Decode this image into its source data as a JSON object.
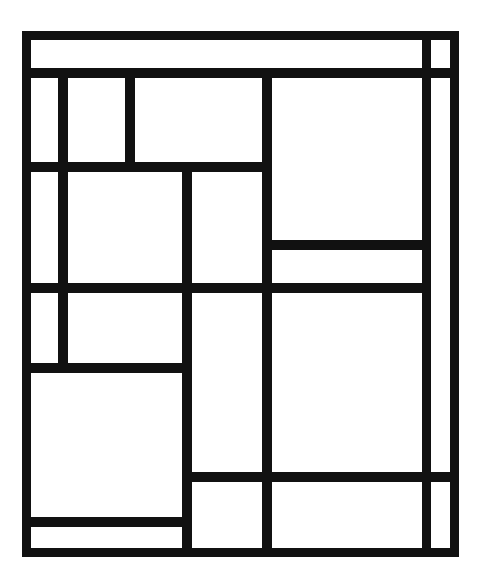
{
  "artwork": {
    "title": "Composition with Grid",
    "style": "De Stijl / Neoplasticism",
    "medium": "Black line grid on white ground",
    "orientation": "portrait",
    "canvas_width": "483",
    "canvas_height": "587",
    "line_color": "#111111",
    "ground_color": "#ffffff",
    "line_count": "18",
    "cell_count": "19"
  },
  "geometry": {
    "frame": {
      "left": 22,
      "top": 31,
      "right": 459,
      "bottom": 557,
      "stroke": 9
    },
    "vertical_lines": [
      {
        "name": "frame-left",
        "x": 22,
        "y1": 31,
        "y2": 557,
        "w": 9
      },
      {
        "name": "v-left-inner",
        "x": 58,
        "y1": 68,
        "y2": 372,
        "w": 10
      },
      {
        "name": "v-upper-short",
        "x": 125,
        "y1": 68,
        "y2": 171,
        "w": 10
      },
      {
        "name": "v-mid-left",
        "x": 182,
        "y1": 162,
        "y2": 557,
        "w": 10
      },
      {
        "name": "v-center",
        "x": 262,
        "y1": 68,
        "y2": 557,
        "w": 10
      },
      {
        "name": "v-right-inner",
        "x": 422,
        "y1": 31,
        "y2": 557,
        "w": 9
      },
      {
        "name": "frame-right",
        "x": 450,
        "y1": 31,
        "y2": 557,
        "w": 9
      }
    ],
    "horizontal_lines": [
      {
        "name": "frame-top",
        "y": 31,
        "x1": 22,
        "x2": 459,
        "h": 9
      },
      {
        "name": "h-top-band",
        "y": 68,
        "x1": 22,
        "x2": 459,
        "h": 10
      },
      {
        "name": "h-second-band",
        "y": 162,
        "x1": 22,
        "x2": 272,
        "h": 10
      },
      {
        "name": "h-right-thin-top",
        "y": 240,
        "x1": 262,
        "x2": 431,
        "h": 10
      },
      {
        "name": "h-third-band",
        "y": 283,
        "x1": 22,
        "x2": 431,
        "h": 10
      },
      {
        "name": "h-left-fourth",
        "y": 363,
        "x1": 22,
        "x2": 192,
        "h": 10
      },
      {
        "name": "h-lower-band",
        "y": 472,
        "x1": 182,
        "x2": 459,
        "h": 10
      },
      {
        "name": "h-bottom-strip",
        "y": 517,
        "x1": 22,
        "x2": 192,
        "h": 10
      },
      {
        "name": "frame-bottom",
        "y": 548,
        "x1": 22,
        "x2": 459,
        "h": 9
      }
    ],
    "cells": [
      {
        "name": "cell-top-left-strip",
        "x": 31,
        "y": 40,
        "w": 94,
        "h": 28
      },
      {
        "name": "cell-top-wide-strip",
        "x": 135,
        "y": 40,
        "w": 287,
        "h": 28
      },
      {
        "name": "cell-top-right-small",
        "x": 431,
        "y": 40,
        "w": 19,
        "h": 28
      },
      {
        "name": "cell-left-tall-a",
        "x": 31,
        "y": 78,
        "w": 27,
        "h": 84
      },
      {
        "name": "cell-upper-square",
        "x": 68,
        "y": 78,
        "w": 57,
        "h": 84
      },
      {
        "name": "cell-upper-wide",
        "x": 135,
        "y": 78,
        "w": 127,
        "h": 84
      },
      {
        "name": "cell-big-right",
        "x": 272,
        "y": 78,
        "w": 150,
        "h": 162
      },
      {
        "name": "cell-left-tall-b",
        "x": 31,
        "y": 172,
        "w": 27,
        "h": 111
      },
      {
        "name": "cell-center-big",
        "x": 68,
        "y": 172,
        "w": 114,
        "h": 111
      },
      {
        "name": "cell-center-narrow",
        "x": 192,
        "y": 172,
        "w": 70,
        "h": 111
      },
      {
        "name": "cell-right-thin-strip",
        "x": 272,
        "y": 250,
        "w": 150,
        "h": 33
      },
      {
        "name": "cell-right-column",
        "x": 431,
        "y": 78,
        "w": 19,
        "h": 470
      },
      {
        "name": "cell-left-tall-c",
        "x": 31,
        "y": 293,
        "w": 27,
        "h": 70
      },
      {
        "name": "cell-mid-left-block",
        "x": 68,
        "y": 293,
        "w": 114,
        "h": 70
      },
      {
        "name": "cell-tall-column",
        "x": 192,
        "y": 293,
        "w": 70,
        "h": 179
      },
      {
        "name": "cell-lower-right-big",
        "x": 272,
        "y": 293,
        "w": 150,
        "h": 179
      },
      {
        "name": "cell-bottom-left-big",
        "x": 31,
        "y": 373,
        "w": 151,
        "h": 144
      },
      {
        "name": "cell-bottom-strip",
        "x": 31,
        "y": 527,
        "w": 151,
        "h": 21
      },
      {
        "name": "cell-bottom-mid",
        "x": 192,
        "y": 482,
        "w": 70,
        "h": 66
      },
      {
        "name": "cell-bottom-right",
        "x": 272,
        "y": 482,
        "w": 150,
        "h": 66
      }
    ]
  }
}
